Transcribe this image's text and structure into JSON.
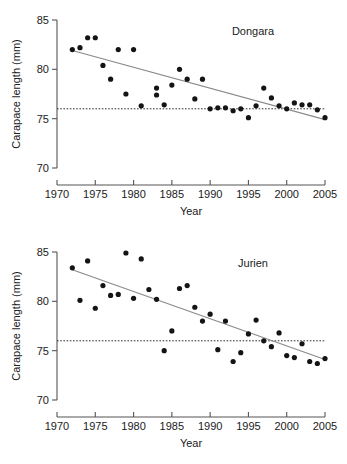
{
  "figure": {
    "width": 347,
    "height": 464,
    "background": "#ffffff",
    "marker_color": "#141414",
    "trend_color": "#8a8a8a",
    "axis_color": "#555555",
    "refline_color": "#2b2b2b"
  },
  "chart_data": [
    {
      "type": "scatter",
      "title": "Dongara",
      "xlabel": "Year",
      "ylabel": "Carapace length (mm)",
      "xlim": [
        1970,
        2005
      ],
      "ylim": [
        70,
        85
      ],
      "xticks": [
        1970,
        1975,
        1980,
        1985,
        1990,
        1995,
        2000,
        2005
      ],
      "xtick_labels": [
        "1970",
        "1975",
        "1980",
        "1985",
        "1990",
        "1995",
        "2000",
        "2005"
      ],
      "yticks": [
        70,
        75,
        80,
        85
      ],
      "ytick_labels": [
        "70",
        "75",
        "80",
        "85"
      ],
      "grid": false,
      "legend": null,
      "reference_line": {
        "kind": "horizontal",
        "y": 76.0,
        "style": "dotted"
      },
      "trend_line": {
        "kind": "linear-fit",
        "x_start": 1972,
        "y_start": 81.9,
        "x_end": 2005,
        "y_end": 74.9
      },
      "points": [
        {
          "x": 1972,
          "y": 82.0
        },
        {
          "x": 1973,
          "y": 82.2
        },
        {
          "x": 1974,
          "y": 83.2
        },
        {
          "x": 1975,
          "y": 83.2
        },
        {
          "x": 1976,
          "y": 80.4
        },
        {
          "x": 1977,
          "y": 79.0
        },
        {
          "x": 1978,
          "y": 82.0
        },
        {
          "x": 1979,
          "y": 77.5
        },
        {
          "x": 1980,
          "y": 82.0
        },
        {
          "x": 1981,
          "y": 76.3
        },
        {
          "x": 1983,
          "y": 77.4
        },
        {
          "x": 1983,
          "y": 78.1
        },
        {
          "x": 1984,
          "y": 76.4
        },
        {
          "x": 1985,
          "y": 78.4
        },
        {
          "x": 1986,
          "y": 80.0
        },
        {
          "x": 1987,
          "y": 79.0
        },
        {
          "x": 1988,
          "y": 77.0
        },
        {
          "x": 1989,
          "y": 79.0
        },
        {
          "x": 1990,
          "y": 76.0
        },
        {
          "x": 1991,
          "y": 76.1
        },
        {
          "x": 1992,
          "y": 76.1
        },
        {
          "x": 1993,
          "y": 75.8
        },
        {
          "x": 1994,
          "y": 76.0
        },
        {
          "x": 1995,
          "y": 75.1
        },
        {
          "x": 1996,
          "y": 76.3
        },
        {
          "x": 1997,
          "y": 78.1
        },
        {
          "x": 1998,
          "y": 77.1
        },
        {
          "x": 1999,
          "y": 76.3
        },
        {
          "x": 2000,
          "y": 76.0
        },
        {
          "x": 2001,
          "y": 76.6
        },
        {
          "x": 2002,
          "y": 76.4
        },
        {
          "x": 2003,
          "y": 76.4
        },
        {
          "x": 2004,
          "y": 75.9
        },
        {
          "x": 2005,
          "y": 75.1
        }
      ]
    },
    {
      "type": "scatter",
      "title": "Jurien",
      "xlabel": "Year",
      "ylabel": "Carapace length (mm)",
      "xlim": [
        1970,
        2005
      ],
      "ylim": [
        70,
        85
      ],
      "xticks": [
        1970,
        1975,
        1980,
        1985,
        1990,
        1995,
        2000,
        2005
      ],
      "xtick_labels": [
        "1970",
        "1975",
        "1980",
        "1985",
        "1990",
        "1995",
        "2000",
        "2005"
      ],
      "yticks": [
        70,
        75,
        80,
        85
      ],
      "ytick_labels": [
        "70",
        "75",
        "80",
        "85"
      ],
      "grid": false,
      "legend": null,
      "reference_line": {
        "kind": "horizontal",
        "y": 76.0,
        "style": "dotted"
      },
      "trend_line": {
        "kind": "linear-fit",
        "x_start": 1972,
        "y_start": 83.2,
        "x_end": 2005,
        "y_end": 74.1
      },
      "points": [
        {
          "x": 1972,
          "y": 83.4
        },
        {
          "x": 1973,
          "y": 80.1
        },
        {
          "x": 1974,
          "y": 84.1
        },
        {
          "x": 1975,
          "y": 79.3
        },
        {
          "x": 1976,
          "y": 81.6
        },
        {
          "x": 1977,
          "y": 80.6
        },
        {
          "x": 1978,
          "y": 80.7
        },
        {
          "x": 1979,
          "y": 84.9
        },
        {
          "x": 1980,
          "y": 80.3
        },
        {
          "x": 1981,
          "y": 84.3
        },
        {
          "x": 1982,
          "y": 81.2
        },
        {
          "x": 1983,
          "y": 80.2
        },
        {
          "x": 1984,
          "y": 75.0
        },
        {
          "x": 1985,
          "y": 77.0
        },
        {
          "x": 1986,
          "y": 81.3
        },
        {
          "x": 1987,
          "y": 81.6
        },
        {
          "x": 1988,
          "y": 79.4
        },
        {
          "x": 1989,
          "y": 78.0
        },
        {
          "x": 1990,
          "y": 78.7
        },
        {
          "x": 1991,
          "y": 75.1
        },
        {
          "x": 1992,
          "y": 78.0
        },
        {
          "x": 1993,
          "y": 73.9
        },
        {
          "x": 1994,
          "y": 74.8
        },
        {
          "x": 1995,
          "y": 76.7
        },
        {
          "x": 1996,
          "y": 78.1
        },
        {
          "x": 1997,
          "y": 76.0
        },
        {
          "x": 1998,
          "y": 75.4
        },
        {
          "x": 1999,
          "y": 76.8
        },
        {
          "x": 2000,
          "y": 74.5
        },
        {
          "x": 2001,
          "y": 74.3
        },
        {
          "x": 2002,
          "y": 75.7
        },
        {
          "x": 2003,
          "y": 73.9
        },
        {
          "x": 2004,
          "y": 73.7
        },
        {
          "x": 2005,
          "y": 74.2
        }
      ]
    }
  ]
}
